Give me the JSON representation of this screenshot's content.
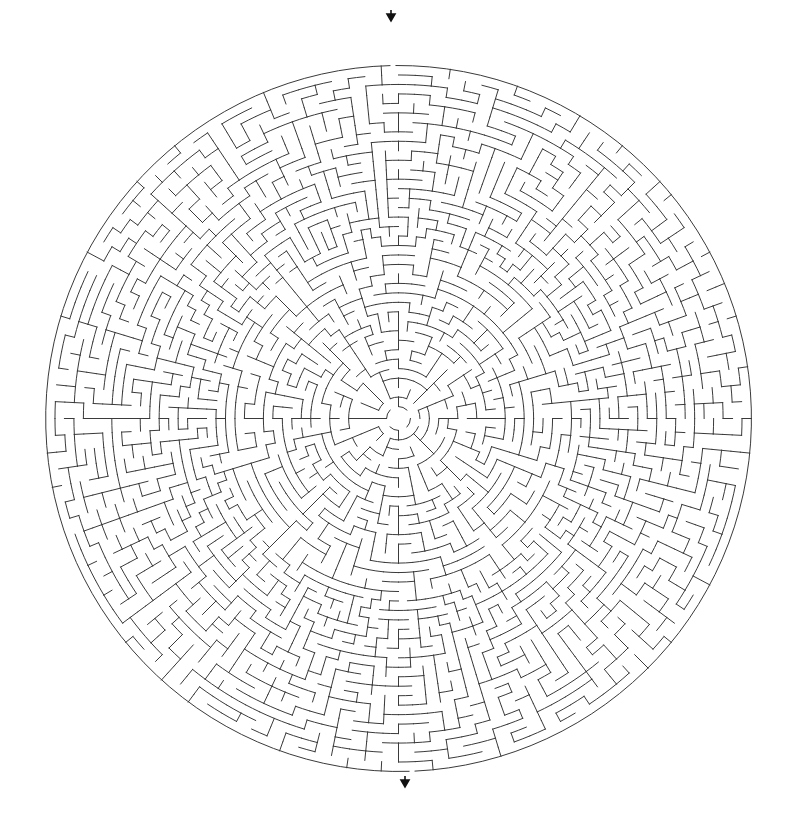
{
  "puzzle": {
    "type": "circular-maze",
    "center": {
      "x": 398.5,
      "y": 418.5
    },
    "outer_radius": 353,
    "inner_radius": 12,
    "rings": 36,
    "base_cells": 8,
    "target_cell_width": 9.5,
    "seed": 20240517,
    "wall_color": "#3a3a3a",
    "background": "#ffffff",
    "entrance": {
      "label": "start-arrow",
      "angle_deg": -90.9,
      "arrow_x": 391,
      "arrow_top": 10,
      "arrow_bottom": 20,
      "gap_half_width_px": 3
    },
    "exit": {
      "label": "end-arrow",
      "angle_deg": 87.8,
      "arrow_x": 405,
      "arrow_top": 776,
      "arrow_bottom": 786,
      "gap_half_width_px": 3
    }
  }
}
